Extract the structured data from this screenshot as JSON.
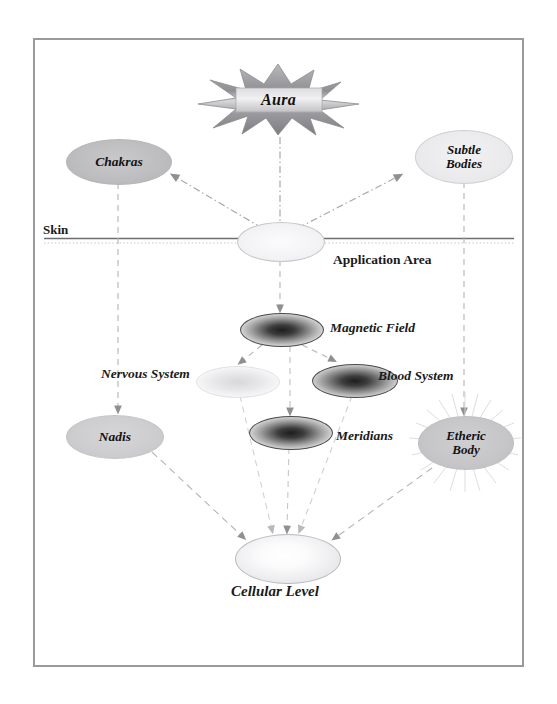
{
  "diagram": {
    "title_nodes": {
      "aura": "Aura",
      "chakras": "Chakras",
      "subtle_bodies": "Subtle\nBodies",
      "application_area": "Application Area",
      "skin": "Skin",
      "magnetic_field": "Magnetic Field",
      "blood_system": "Blood System",
      "nervous_system": "Nervous System",
      "meridians": "Meridians",
      "nadis": "Nadis",
      "etheric_body": "Etheric\nBody",
      "cellular_level": "Cellular Level"
    },
    "colors": {
      "frame_border": "#9a9a9e",
      "node_gray": "#c9c9cb",
      "node_light": "#f2f2f3",
      "node_dark_center": "#1d1d1d",
      "arrow": "#9b9b9f",
      "skin_line": "#6e6e72",
      "text": "#1a1a1a"
    },
    "edges": [
      {
        "from": "aura",
        "to": "application_area",
        "style": "dash-dot"
      },
      {
        "from": "application_area",
        "to": "chakras",
        "style": "dash-dot"
      },
      {
        "from": "application_area",
        "to": "subtle_bodies",
        "style": "dash-dot"
      },
      {
        "from": "chakras",
        "to": "nadis",
        "style": "dashed",
        "label": "Nervous System"
      },
      {
        "from": "subtle_bodies",
        "to": "etheric_body",
        "style": "dashed"
      },
      {
        "from": "application_area",
        "to": "magnetic_field",
        "style": "dashed"
      },
      {
        "from": "magnetic_field",
        "to": "nervous_ellipse",
        "style": "dashed"
      },
      {
        "from": "magnetic_field",
        "to": "blood_system",
        "style": "dashed"
      },
      {
        "from": "application_area",
        "to": "meridians",
        "style": "dashed"
      },
      {
        "from": "nervous_ellipse",
        "to": "cellular_level",
        "style": "dashed"
      },
      {
        "from": "blood_system",
        "to": "cellular_level",
        "style": "dashed"
      },
      {
        "from": "meridians",
        "to": "cellular_level",
        "style": "dashed"
      },
      {
        "from": "nadis",
        "to": "cellular_level",
        "style": "dashed"
      },
      {
        "from": "etheric_body",
        "to": "cellular_level",
        "style": "dashed"
      }
    ]
  }
}
